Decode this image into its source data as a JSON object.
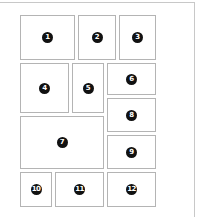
{
  "diagram": {
    "type": "page-layout-grid",
    "colors": {
      "border": "#b4b4b4",
      "frame": "#c8c8c8",
      "badge_bg": "#111111",
      "badge_text": "#ffffff"
    },
    "panels": [
      {
        "label": "1",
        "x": 20,
        "y": 15,
        "w": 55,
        "h": 45
      },
      {
        "label": "2",
        "x": 78,
        "y": 15,
        "w": 38,
        "h": 45
      },
      {
        "label": "3",
        "x": 119,
        "y": 15,
        "w": 37,
        "h": 45
      },
      {
        "label": "4",
        "x": 20,
        "y": 63,
        "w": 49,
        "h": 50
      },
      {
        "label": "5",
        "x": 72,
        "y": 63,
        "w": 32,
        "h": 50
      },
      {
        "label": "6",
        "x": 107,
        "y": 63,
        "w": 49,
        "h": 32
      },
      {
        "label": "7",
        "x": 20,
        "y": 116,
        "w": 84,
        "h": 53
      },
      {
        "label": "8",
        "x": 107,
        "y": 98,
        "w": 49,
        "h": 34
      },
      {
        "label": "9",
        "x": 107,
        "y": 135,
        "w": 49,
        "h": 34
      },
      {
        "label": "10",
        "x": 20,
        "y": 172,
        "w": 32,
        "h": 35
      },
      {
        "label": "11",
        "x": 55,
        "y": 172,
        "w": 49,
        "h": 35
      },
      {
        "label": "12",
        "x": 107,
        "y": 172,
        "w": 49,
        "h": 35
      }
    ]
  }
}
